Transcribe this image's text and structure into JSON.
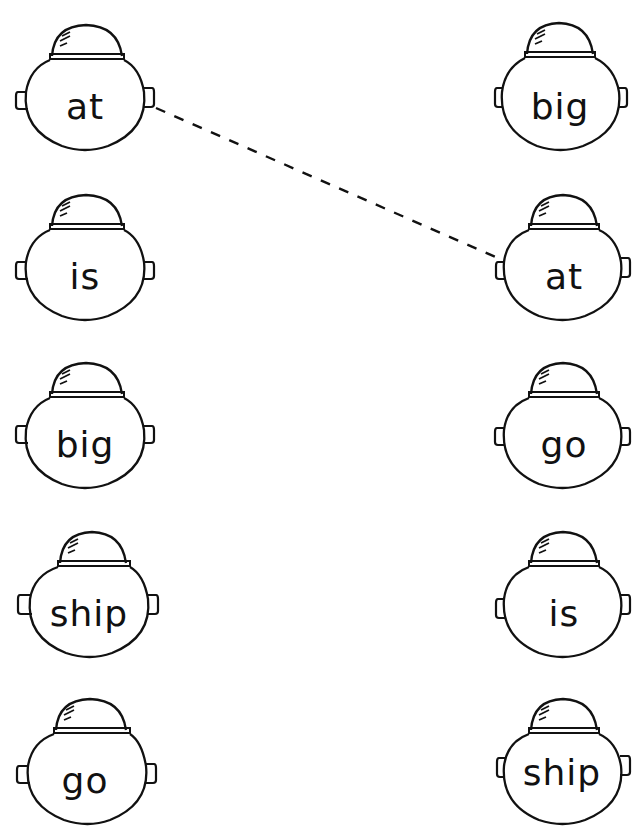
{
  "worksheet": {
    "type": "word-matching",
    "colors": {
      "ink": "#111111",
      "paper": "#ffffff"
    },
    "left_column": [
      {
        "word": "at"
      },
      {
        "word": "is"
      },
      {
        "word": "big"
      },
      {
        "word": "ship"
      },
      {
        "word": "go"
      }
    ],
    "right_column": [
      {
        "word": "big"
      },
      {
        "word": "at"
      },
      {
        "word": "go"
      },
      {
        "word": "is"
      },
      {
        "word": "ship"
      }
    ],
    "connections": [
      {
        "from_left_index": 0,
        "to_right_index": 1,
        "style": "dashed",
        "word": "at"
      }
    ]
  }
}
